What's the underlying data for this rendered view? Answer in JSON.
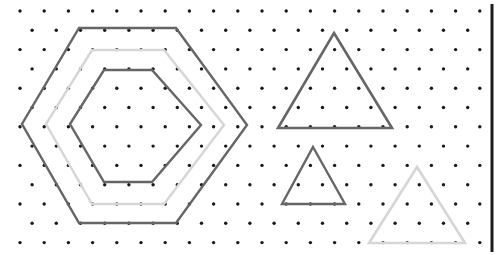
{
  "canvas": {
    "width": 496,
    "height": 255,
    "background": "#ffffff",
    "title": "Isometric dot grid with nested hexagons and triangles"
  },
  "colors": {
    "dot": "#1a1a1a",
    "dark_stroke": "#666666",
    "light_stroke": "#d6d6d6",
    "border": "#1c1c1c",
    "background": "#ffffff"
  },
  "dot_grid": {
    "name": "triangular-dot-lattice",
    "origin_x": 20,
    "origin_y": 11,
    "spacing_x": 24.2,
    "spacing_y": 19.3,
    "row_offset_x": 12.1,
    "columns": 20,
    "rows": 13,
    "dot_radius": 1.7,
    "max_x": 486
  },
  "border": {
    "name": "right-edge-rule",
    "x": 492,
    "y1": 4,
    "y2": 252,
    "width": 3,
    "color": "#1c1c1c"
  },
  "shapes": [
    {
      "id": "hexagon-outer",
      "label": "Outer hexagon",
      "type": "hexagon",
      "stroke": "#666666",
      "stroke_width": 2.4,
      "points": "79,28 176,28 247,125 176,223 79,223 22,124"
    },
    {
      "id": "hexagon-middle",
      "label": "Middle hexagon",
      "type": "hexagon",
      "stroke": "#d6d6d6",
      "stroke_width": 2.4,
      "points": "92,50 164,50 224,125 164,204 92,204 46,124"
    },
    {
      "id": "hexagon-inner",
      "label": "Inner hexagon",
      "type": "hexagon",
      "stroke": "#666666",
      "stroke_width": 2.4,
      "points": "104,70 152,70 201,125 152,182 104,182 70,124"
    },
    {
      "id": "triangle-large",
      "label": "Large triangle",
      "type": "triangle",
      "stroke": "#666666",
      "stroke_width": 2.6,
      "points": "334,33 392,128 278,128"
    },
    {
      "id": "triangle-medium",
      "label": "Medium triangle",
      "type": "triangle",
      "stroke": "#666666",
      "stroke_width": 2.4,
      "points": "313,147 345,204 282,204"
    },
    {
      "id": "triangle-light",
      "label": "Light triangle",
      "type": "triangle",
      "stroke": "#d6d6d6",
      "stroke_width": 2.6,
      "points": "417,167 465,243 369,243"
    }
  ]
}
